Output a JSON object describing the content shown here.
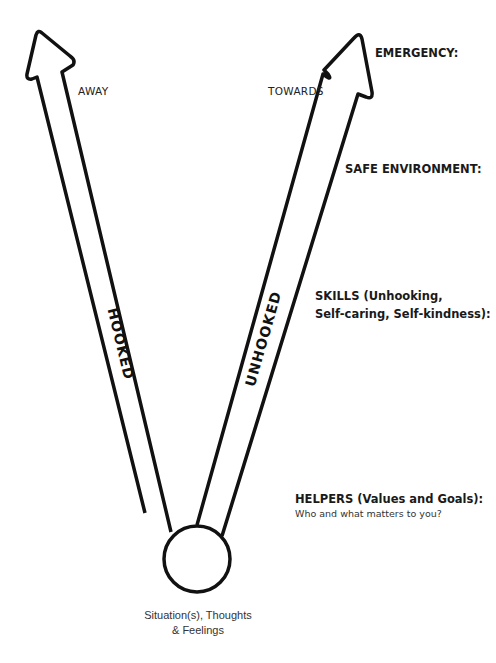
{
  "arrows": {
    "left": {
      "direction_label": "AWAY",
      "shaft_label": "HOOKED"
    },
    "right": {
      "direction_label": "TOWARDS",
      "shaft_label": "UNHOOKED"
    }
  },
  "origin": {
    "caption_line1": "Situation(s), Thoughts",
    "caption_line2": "& Feelings"
  },
  "sections": [
    {
      "heading": "EMERGENCY:"
    },
    {
      "heading": "SAFE ENVIRONMENT:"
    },
    {
      "heading_line1": "SKILLS (Unhooking,",
      "heading_line2": "Self-caring, Self-kindness):"
    },
    {
      "heading": "HELPERS (Values and Goals):",
      "subtext": "Who and what matters to you?"
    }
  ],
  "colors": {
    "stroke": "#111111",
    "background": "#ffffff"
  }
}
